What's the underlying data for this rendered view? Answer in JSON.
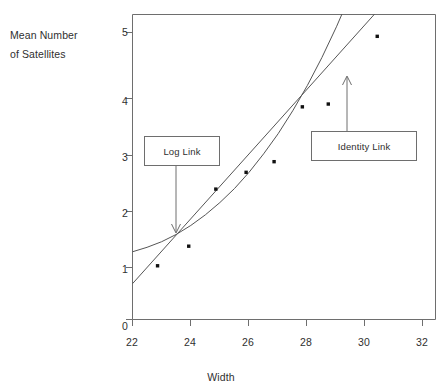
{
  "chart_data": {
    "type": "scatter",
    "title": "",
    "xlabel": "Width",
    "ylabel": "Mean Number of Satellites",
    "ylabel_lines": [
      "Mean Number",
      "of Satellites"
    ],
    "xlim": [
      22,
      32.4
    ],
    "ylim": [
      0,
      5.45
    ],
    "grid": false,
    "legend": "none",
    "xticks": [
      22,
      24,
      26,
      28,
      30,
      32
    ],
    "xtick_labels": [
      "22",
      "24",
      "26",
      "28",
      "30",
      "32"
    ],
    "yticks": [
      0,
      1,
      2,
      3,
      4,
      5
    ],
    "ytick_labels": [
      "0",
      "1",
      "2",
      "3",
      "4",
      "5"
    ],
    "points": [
      {
        "x": 22.86,
        "y": 0.96
      },
      {
        "x": 23.93,
        "y": 1.31
      },
      {
        "x": 24.86,
        "y": 2.33
      },
      {
        "x": 25.9,
        "y": 2.63
      },
      {
        "x": 26.86,
        "y": 2.82
      },
      {
        "x": 27.83,
        "y": 3.8
      },
      {
        "x": 28.72,
        "y": 3.85
      },
      {
        "x": 30.4,
        "y": 5.06
      }
    ],
    "series": [
      {
        "name": "Log Link",
        "type": "curve",
        "points": [
          {
            "x": 22.0,
            "y": 1.21
          },
          {
            "x": 22.5,
            "y": 1.29
          },
          {
            "x": 23.0,
            "y": 1.39
          },
          {
            "x": 23.5,
            "y": 1.52
          },
          {
            "x": 24.0,
            "y": 1.68
          },
          {
            "x": 24.5,
            "y": 1.87
          },
          {
            "x": 25.0,
            "y": 2.09
          },
          {
            "x": 25.5,
            "y": 2.34
          },
          {
            "x": 26.0,
            "y": 2.63
          },
          {
            "x": 26.5,
            "y": 2.96
          },
          {
            "x": 27.0,
            "y": 3.32
          },
          {
            "x": 27.5,
            "y": 3.73
          },
          {
            "x": 28.0,
            "y": 4.18
          },
          {
            "x": 28.5,
            "y": 4.68
          },
          {
            "x": 29.0,
            "y": 5.23
          },
          {
            "x": 29.35,
            "y": 5.65
          },
          {
            "x": 29.6,
            "y": 5.98
          }
        ]
      },
      {
        "name": "Identity Link",
        "type": "line",
        "points": [
          {
            "x": 22.0,
            "y": 0.64
          },
          {
            "x": 32.4,
            "y": 6.67
          }
        ]
      }
    ],
    "annotations": [
      {
        "name": "Log Link",
        "label": "Log Link",
        "arrow_to_x": 23.28,
        "arrow_to_y": 1.54
      },
      {
        "name": "Identity Link",
        "label": "Identity Link",
        "arrow_to_x": 29.25,
        "arrow_to_y": 4.37
      }
    ],
    "colors": {
      "axis": "#6e6e6e",
      "point": "#111111",
      "curve": "#555555",
      "annotation_border": "#6e6e6e",
      "text": "#2f2f2f",
      "background": "#ffffff"
    }
  }
}
